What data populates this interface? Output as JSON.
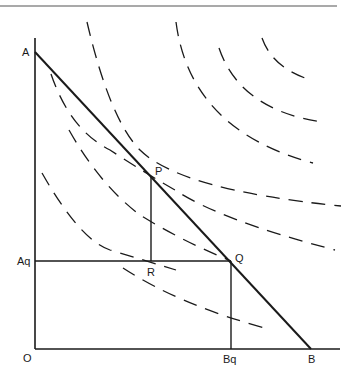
{
  "diagram": {
    "type": "budget-line-with-indifference-curves",
    "labels": {
      "A": "A",
      "B": "B",
      "P": "P",
      "Q": "Q",
      "R": "R",
      "O": "O",
      "Aq": "Aq",
      "Bq": "Bq"
    },
    "points": {
      "origin": [
        35,
        349
      ],
      "A": [
        35,
        52
      ],
      "B": [
        311,
        349
      ],
      "P": [
        151,
        176
      ],
      "Q": [
        231,
        261
      ],
      "R": [
        151,
        261
      ],
      "Aq": [
        35,
        261
      ],
      "Bq": [
        231,
        349
      ]
    },
    "curves": {
      "count": 8,
      "style": "dashed"
    },
    "colors": {
      "ink": "#1a1a1a",
      "rule": "#555555",
      "background": "#ffffff"
    }
  }
}
